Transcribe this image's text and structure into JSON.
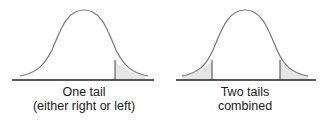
{
  "diagrams": [
    {
      "id": "one-tail",
      "caption_line1": "One tail",
      "caption_line2": "(either right or left)",
      "shaded_regions": [
        "right"
      ],
      "center_x": 84,
      "baseline": {
        "x1": 12,
        "x2": 154,
        "y": 80
      },
      "cut_x": [
        115
      ]
    },
    {
      "id": "two-tails",
      "caption_line1": "Two tails",
      "caption_line2": "combined",
      "shaded_regions": [
        "left",
        "right"
      ],
      "center_x": 245,
      "baseline": {
        "x1": 176,
        "x2": 316,
        "y": 80
      },
      "cut_x": [
        212,
        280
      ]
    }
  ],
  "colors": {
    "curve": "#777777",
    "baseline": "#222222",
    "cut_line": "#444444",
    "shade": "#e6e6e6",
    "text": "#1a1a1a"
  }
}
